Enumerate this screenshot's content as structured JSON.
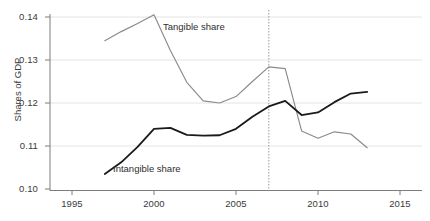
{
  "chart_data": {
    "type": "line",
    "title": "",
    "xlabel": "",
    "ylabel": "Shares of GDP",
    "xlim": [
      1995,
      2015
    ],
    "ylim": [
      0.1,
      0.14
    ],
    "grid": "horizontal",
    "legend_position": "inline-annotations",
    "x_ticks": [
      "1995",
      "2000",
      "2005",
      "2010",
      "2015"
    ],
    "y_ticks": [
      "0.10",
      "0.11",
      "0.12",
      "0.13",
      "0.14"
    ],
    "annotations": [
      {
        "text": "Tangible share",
        "series": "Tangible share"
      },
      {
        "text": "Intangible share",
        "series": "Intangible share"
      }
    ],
    "reference_line": {
      "orientation": "vertical",
      "x": 2007,
      "style": "dotted"
    },
    "x": [
      1997,
      1998,
      1999,
      2000,
      2001,
      2002,
      2003,
      2004,
      2005,
      2006,
      2007,
      2008,
      2009,
      2010,
      2011,
      2012,
      2013
    ],
    "series": [
      {
        "name": "Tangible share",
        "color": "#8a8a8a",
        "values": [
          0.1345,
          0.1366,
          0.1385,
          0.1405,
          0.1322,
          0.1248,
          0.1205,
          0.12,
          0.1215,
          0.125,
          0.1284,
          0.128,
          0.1135,
          0.1118,
          0.1133,
          0.1128,
          0.1096
        ]
      },
      {
        "name": "Intangible share",
        "color": "#1a1a1a",
        "values": [
          0.1035,
          0.1062,
          0.1098,
          0.114,
          0.1142,
          0.1126,
          0.1124,
          0.1125,
          0.114,
          0.1168,
          0.1192,
          0.1205,
          0.1172,
          0.1178,
          0.1202,
          0.1222,
          0.1226
        ]
      }
    ]
  },
  "axis": {
    "y_title": "Shares of GDP",
    "y_tick_labels": [
      "0.14",
      "0.13",
      "0.12",
      "0.11",
      "0.10"
    ],
    "x_tick_labels": [
      "1995",
      "2000",
      "2005",
      "2010",
      "2015"
    ]
  },
  "labels": {
    "tangible": "Tangible share",
    "intangible": "Intangible share"
  },
  "colors": {
    "tangible_line": "#8a8a8a",
    "intangible_line": "#1a1a1a",
    "gridline": "#e2e2e2",
    "axis": "#767676",
    "text": "#3a3a3a"
  }
}
